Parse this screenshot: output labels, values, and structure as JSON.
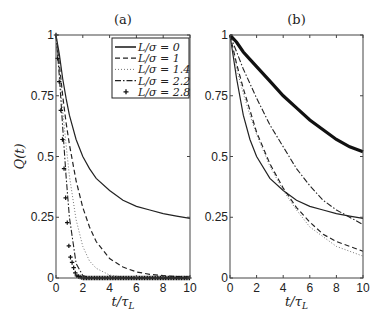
{
  "chart_data": [
    {
      "type": "line",
      "title": "(a)",
      "xlabel": "t/τ_L",
      "ylabel": "Q(t)",
      "xlim": [
        0,
        10
      ],
      "ylim": [
        0,
        1
      ],
      "xticks": [
        "0",
        "2",
        "4",
        "6",
        "8",
        "10"
      ],
      "yticks": [
        "0",
        "0.25",
        "0.5",
        "0.75",
        "1"
      ],
      "grid": false,
      "legend_position": "upper right",
      "x": [
        0,
        0.25,
        0.5,
        0.75,
        1,
        1.5,
        2,
        2.5,
        3,
        4,
        5,
        6,
        7,
        8,
        9,
        10
      ],
      "series": [
        {
          "name": "L/σ = 0",
          "style": "solid",
          "values": [
            1,
            0.92,
            0.82,
            0.74,
            0.67,
            0.57,
            0.5,
            0.45,
            0.41,
            0.36,
            0.32,
            0.295,
            0.28,
            0.265,
            0.255,
            0.245
          ]
        },
        {
          "name": "L/σ = 1",
          "style": "dashed",
          "values": [
            1,
            0.88,
            0.75,
            0.64,
            0.55,
            0.4,
            0.29,
            0.21,
            0.15,
            0.08,
            0.045,
            0.025,
            0.015,
            0.01,
            0.006,
            0.004
          ]
        },
        {
          "name": "L/σ = 1.4",
          "style": "dotted",
          "values": [
            1,
            0.85,
            0.69,
            0.55,
            0.42,
            0.24,
            0.13,
            0.07,
            0.04,
            0.012,
            0.004,
            0.002,
            0.001,
            0.0,
            0.0,
            0.0
          ]
        },
        {
          "name": "L/σ = 2.2",
          "style": "dashdot",
          "values": [
            1,
            0.83,
            0.62,
            0.42,
            0.25,
            0.06,
            0.01,
            0.002,
            0.0,
            0.0,
            0.0,
            0.0,
            0.0,
            0.0,
            0.0,
            0.0
          ]
        },
        {
          "name": "L/σ = 2.8",
          "style": "plus",
          "values": [
            1,
            0.8,
            0.55,
            0.3,
            0.1,
            0.01,
            0.0,
            0.0,
            0.0,
            0.0,
            0.0,
            0.0,
            0.0,
            0.0,
            0.0,
            0.0
          ]
        }
      ]
    },
    {
      "type": "line",
      "title": "(b)",
      "xlabel": "t/τ_L",
      "ylabel": "",
      "xlim": [
        0,
        10
      ],
      "ylim": [
        0,
        1
      ],
      "xticks": [
        "0",
        "2",
        "4",
        "6",
        "8",
        "10"
      ],
      "yticks": [
        "0",
        "0.25",
        "0.5",
        "0.75",
        "1"
      ],
      "grid": false,
      "x": [
        0,
        0.5,
        1,
        1.5,
        2,
        3,
        4,
        5,
        6,
        7,
        8,
        9,
        10
      ],
      "series": [
        {
          "name": "L/σ = 0",
          "style": "solid",
          "values": [
            1,
            0.82,
            0.67,
            0.57,
            0.5,
            0.41,
            0.36,
            0.32,
            0.295,
            0.28,
            0.265,
            0.255,
            0.245
          ]
        },
        {
          "name": "L/σ = 1",
          "style": "dashed",
          "values": [
            1,
            0.88,
            0.78,
            0.69,
            0.6,
            0.47,
            0.37,
            0.29,
            0.23,
            0.18,
            0.15,
            0.13,
            0.11
          ]
        },
        {
          "name": "L/σ = 1.4",
          "style": "dotted",
          "values": [
            1,
            0.86,
            0.76,
            0.67,
            0.59,
            0.46,
            0.36,
            0.28,
            0.21,
            0.17,
            0.13,
            0.11,
            0.09
          ]
        },
        {
          "name": "L/σ = 2.2",
          "style": "dashdot",
          "values": [
            1,
            0.93,
            0.86,
            0.8,
            0.74,
            0.63,
            0.54,
            0.45,
            0.38,
            0.32,
            0.28,
            0.25,
            0.22
          ]
        },
        {
          "name": "L/σ = 2.8",
          "style": "plus",
          "values": [
            1,
            0.97,
            0.93,
            0.9,
            0.87,
            0.81,
            0.75,
            0.7,
            0.65,
            0.61,
            0.57,
            0.54,
            0.52
          ]
        }
      ]
    }
  ]
}
